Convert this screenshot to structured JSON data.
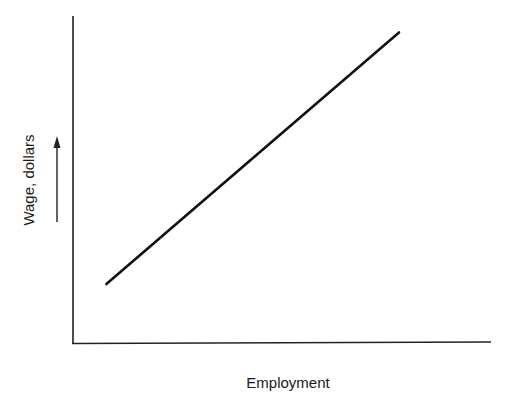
{
  "chart_data": {
    "type": "line",
    "title": "",
    "xlabel": "Employment",
    "ylabel": "Wage, dollars",
    "grid": false,
    "legend": null,
    "ticks": {
      "x": [],
      "y": []
    },
    "series": [
      {
        "name": "Labor supply curve",
        "points": [
          {
            "x": 0.08,
            "y": 0.18
          },
          {
            "x": 0.78,
            "y": 0.95
          }
        ]
      }
    ],
    "xlim": [
      0,
      1
    ],
    "ylim": [
      0,
      1
    ],
    "annotations": [
      {
        "type": "arrow",
        "direction": "up",
        "position": "beside y-axis label"
      }
    ]
  },
  "colors": {
    "line": "#111111",
    "axis": "#222222",
    "text": "#1a1a1a"
  }
}
